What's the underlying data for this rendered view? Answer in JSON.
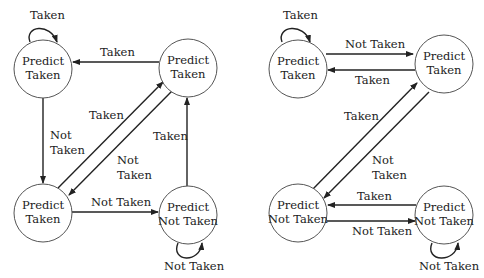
{
  "diagrams": [
    {
      "name": "left-fsm",
      "states": [
        {
          "id": "s0",
          "line1": "Predict",
          "line2": "Taken"
        },
        {
          "id": "s1",
          "line1": "Predict",
          "line2": "Taken"
        },
        {
          "id": "s2",
          "line1": "Predict",
          "line2": "Taken"
        },
        {
          "id": "s3",
          "line1": "Predict",
          "line2": "Not Taken"
        }
      ],
      "edges": {
        "self_s0": "Taken",
        "s1_to_s0": "Taken",
        "s0_to_s2_l1": "Not",
        "s0_to_s2_l2": "Taken",
        "s2_to_s1": "Taken",
        "s1_to_s2_l1": "Not",
        "s1_to_s2_l2": "Taken",
        "s3_to_s1": "Taken",
        "s2_to_s3": "Not Taken",
        "self_s3": "Not Taken"
      }
    },
    {
      "name": "right-fsm",
      "states": [
        {
          "id": "s0",
          "line1": "Predict",
          "line2": "Taken"
        },
        {
          "id": "s1",
          "line1": "Predict",
          "line2": "Taken"
        },
        {
          "id": "s2",
          "line1": "Predict",
          "line2": "Not Taken"
        },
        {
          "id": "s3",
          "line1": "Predict",
          "line2": "Not Taken"
        }
      ],
      "edges": {
        "self_s0": "Taken",
        "s0_to_s1": "Not Taken",
        "s1_to_s0": "Taken",
        "s2_to_s1": "Taken",
        "s1_to_s2_l1": "Not",
        "s1_to_s2_l2": "Taken",
        "s3_to_s2": "Taken",
        "s2_to_s3": "Not Taken",
        "self_s3": "Not Taken"
      }
    }
  ]
}
